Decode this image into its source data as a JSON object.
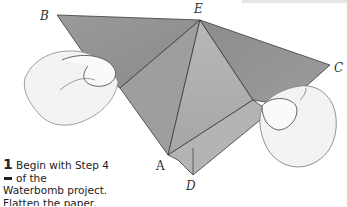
{
  "step": {
    "number": "1",
    "line1": "Begin with Step 4",
    "line2": "of the",
    "line3": "Waterbomb project.",
    "line4": "Flatten the paper."
  },
  "points": {
    "A": "A",
    "B": "B",
    "C": "C",
    "D": "D",
    "E": "E"
  },
  "colors": {
    "paper_dark": "#8d8d8d",
    "paper_mid": "#a3a3a3",
    "paper_light": "#bdbdbd",
    "line": "#3a3a3a",
    "hand": "#f2f2f2"
  }
}
